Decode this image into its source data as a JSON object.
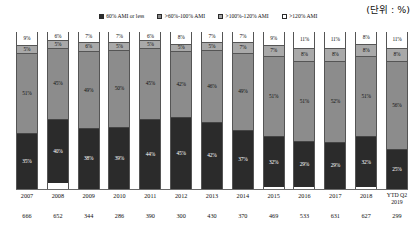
{
  "unit_note": "(단위 : %)",
  "legend": {
    "items": [
      {
        "label": "60% AMI or less",
        "color": "#2d2d2d"
      },
      {
        "label": ">60%-100% AMI",
        "color": "#8a8a8a"
      },
      {
        "label": ">100%-120% AMI",
        "color": "#a8a8a8"
      },
      {
        "label": ">120% AMI",
        "color": "#ffffff"
      }
    ]
  },
  "chart_data": {
    "type": "bar",
    "title": "",
    "subtitle": "",
    "xlabel": "",
    "ylabel": "",
    "ylim": [
      0,
      100
    ],
    "grid": false,
    "stacked": true,
    "normalized_percent": true,
    "legend_position": "top-center",
    "unit": "%",
    "categories": [
      "2007",
      "2008",
      "2009",
      "2010",
      "2011",
      "2012",
      "2013",
      "2014",
      "2015",
      "2016",
      "2017",
      "2018",
      "YTD Q2 2019"
    ],
    "category_lines": [
      [
        "2007"
      ],
      [
        "2008"
      ],
      [
        "2009"
      ],
      [
        "2010"
      ],
      [
        "2011"
      ],
      [
        "2012"
      ],
      [
        "2013"
      ],
      [
        "2014"
      ],
      [
        "2015"
      ],
      [
        "2016"
      ],
      [
        "2017"
      ],
      [
        "2018"
      ],
      [
        "YTD Q2",
        "2019"
      ]
    ],
    "counts": [
      666,
      652,
      344,
      286,
      390,
      300,
      430,
      370,
      469,
      533,
      631,
      627,
      299
    ],
    "series": [
      {
        "name": "60% AMI or less",
        "color": "#2d2d2d",
        "values": [
          35,
          40,
          38,
          39,
          44,
          45,
          42,
          37,
          32,
          29,
          29,
          32,
          25
        ],
        "labels": [
          "35%",
          "40%",
          "38%",
          "39%",
          "44%",
          "45%",
          "42%",
          "37%",
          "32%",
          "29%",
          "29%",
          "32%",
          "25%"
        ]
      },
      {
        "name": ">60%-100% AMI",
        "color": "#8a8a8a",
        "values": [
          51,
          45,
          49,
          50,
          45,
          42,
          46,
          49,
          51,
          51,
          52,
          51,
          56
        ],
        "labels": [
          "51%",
          "45%",
          "49%",
          "50%",
          "45%",
          "42%",
          "46%",
          "49%",
          "51%",
          "51%",
          "52%",
          "51%",
          "56%"
        ]
      },
      {
        "name": ">100%-120% AMI",
        "color": "#a8a8a8",
        "values": [
          5,
          5,
          6,
          5,
          5,
          5,
          5,
          7,
          7,
          8,
          8,
          8,
          8
        ],
        "labels": [
          "5%",
          "5%",
          "6%",
          "5%",
          "5%",
          "5%",
          "5%",
          "7%",
          "7%",
          "8%",
          "8%",
          "8%",
          "8%"
        ]
      },
      {
        "name": ">120% AMI",
        "color": "#ffffff",
        "values": [
          9,
          6,
          7,
          7,
          6,
          8,
          7,
          7,
          9,
          11,
          11,
          8,
          11
        ],
        "labels": [
          "9%",
          "6%",
          "7%",
          "7%",
          "6%",
          "8%",
          "7%",
          "7%",
          "9%",
          "11%",
          "11%",
          "8%",
          "11%"
        ]
      }
    ]
  }
}
